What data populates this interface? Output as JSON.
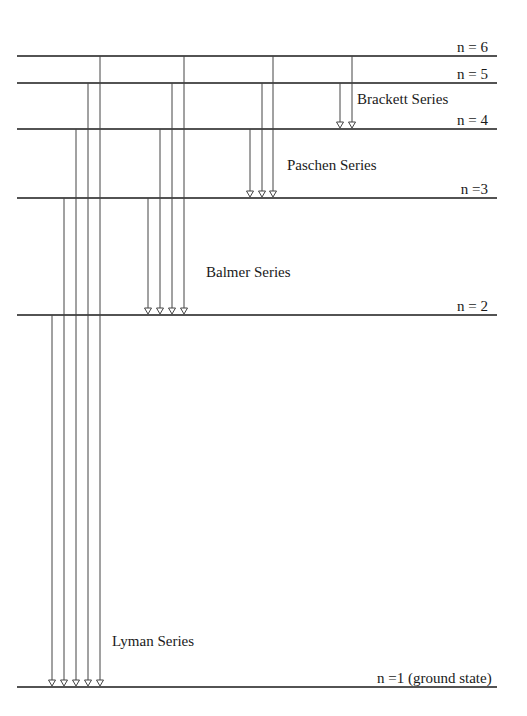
{
  "levels": [
    {
      "n": 6,
      "label": "n = 6",
      "y": 56
    },
    {
      "n": 5,
      "label": "n = 5",
      "y": 83
    },
    {
      "n": 4,
      "label": "n = 4",
      "y": 129
    },
    {
      "n": 3,
      "label": "n =3",
      "y": 198
    },
    {
      "n": 2,
      "label": "n = 2",
      "y": 315
    },
    {
      "n": 1,
      "label": "n =1 (ground state)",
      "y": 687
    }
  ],
  "series": [
    {
      "name": "Lyman Series",
      "label_x": 112,
      "label_y": 642,
      "transitions": [
        {
          "from": 2,
          "x": 52
        },
        {
          "from": 3,
          "x": 64
        },
        {
          "from": 4,
          "x": 76
        },
        {
          "from": 5,
          "x": 88
        },
        {
          "from": 6,
          "x": 100
        }
      ]
    },
    {
      "name": "Balmer Series",
      "label_x": 206,
      "label_y": 273,
      "transitions": [
        {
          "from": 3,
          "x": 148
        },
        {
          "from": 4,
          "x": 160
        },
        {
          "from": 5,
          "x": 172
        },
        {
          "from": 6,
          "x": 184
        }
      ]
    },
    {
      "name": "Paschen Series",
      "label_x": 287,
      "label_y": 166,
      "transitions": [
        {
          "from": 4,
          "x": 250
        },
        {
          "from": 5,
          "x": 262
        },
        {
          "from": 6,
          "x": 273
        }
      ]
    },
    {
      "name": "Brackett Series",
      "label_x": 357,
      "label_y": 100,
      "transitions": [
        {
          "from": 5,
          "x": 340
        },
        {
          "from": 6,
          "x": 352
        }
      ]
    }
  ],
  "line_x_start": 17,
  "line_x_end": 497,
  "colors": {
    "level_line": "#1a1a1a",
    "transition": "#444444",
    "background": "#ffffff"
  }
}
